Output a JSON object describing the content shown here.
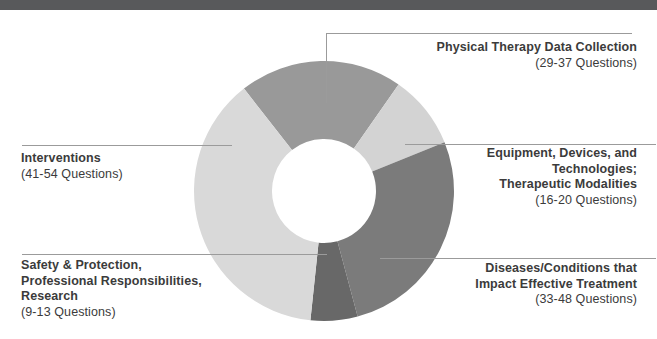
{
  "colors": {
    "header_bar": "#58595b",
    "leader_line": "#9b9b9b",
    "label_text": "#3b3b3b",
    "background": "#ffffff"
  },
  "chart_data": {
    "type": "pie",
    "subtype": "donut",
    "title": "",
    "legend_position": "outside-callouts",
    "units": "exam questions",
    "geometry": {
      "cx": 324,
      "cy": 191,
      "outer_radius": 130,
      "inner_radius": 52
    },
    "segments": [
      {
        "id": "pt-data-collection",
        "label": "Physical Therapy Data Collection",
        "questions": "29-37",
        "start_angle": 322,
        "end_angle": 395,
        "arc_degrees": 73,
        "color": "#999999"
      },
      {
        "id": "equipment-technologies-modalities",
        "label": "Equipment, Devices, and Technologies; Therapeutic Modalities",
        "questions": "16-20",
        "start_angle": 35,
        "end_angle": 68,
        "arc_degrees": 33,
        "color": "#d3d3d3"
      },
      {
        "id": "diseases-conditions",
        "label": "Diseases/Conditions that Impact Effective Treatment",
        "questions": "33-48",
        "start_angle": 68,
        "end_angle": 165,
        "arc_degrees": 97,
        "color": "#7b7b7b"
      },
      {
        "id": "safety-protection-research",
        "label": "Safety & Protection, Professional Responsibilities, Research",
        "questions": "9-13",
        "start_angle": 165,
        "end_angle": 186,
        "arc_degrees": 21,
        "color": "#686868"
      },
      {
        "id": "interventions",
        "label": "Interventions",
        "questions": "41-54",
        "start_angle": 186,
        "end_angle": 322,
        "arc_degrees": 136,
        "color": "#d9d9d9"
      }
    ]
  },
  "labels": {
    "pt_data_collection": {
      "lines": [
        "Physical Therapy Data Collection"
      ],
      "range": "(29-37 Questions)"
    },
    "equipment": {
      "lines": [
        "Equipment, Devices, and",
        "Technologies;",
        "Therapeutic Modalities"
      ],
      "range": "(16-20 Questions)"
    },
    "diseases": {
      "lines": [
        "Diseases/Conditions that",
        "Impact Effective Treatment"
      ],
      "range": "(33-48 Questions)"
    },
    "safety": {
      "lines": [
        "Safety & Protection,",
        "Professional Responsibilities,",
        "Research"
      ],
      "range": "(9-13 Questions)"
    },
    "interventions": {
      "lines": [
        "Interventions"
      ],
      "range": "(41-54 Questions)"
    }
  }
}
